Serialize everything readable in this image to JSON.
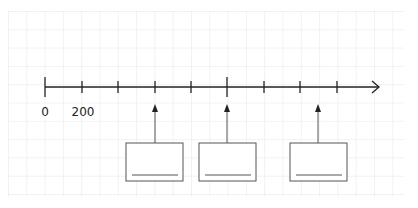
{
  "diagram": {
    "type": "number-line",
    "labels": [
      {
        "text": "0",
        "x": 45
      },
      {
        "text": "200",
        "x": 83
      }
    ],
    "axis": {
      "y": 87,
      "x_start": 45,
      "x_end": 379
    },
    "ticks": [
      {
        "x": 45,
        "major": true
      },
      {
        "x": 82,
        "major": false
      },
      {
        "x": 118,
        "major": false
      },
      {
        "x": 155,
        "major": false
      },
      {
        "x": 191,
        "major": false
      },
      {
        "x": 227,
        "major": true
      },
      {
        "x": 264,
        "major": false
      },
      {
        "x": 300,
        "major": false
      },
      {
        "x": 337,
        "major": false
      }
    ],
    "answer_boxes": [
      {
        "x": 126,
        "pointer_x": 155,
        "value": ""
      },
      {
        "x": 199,
        "pointer_x": 227,
        "value": ""
      },
      {
        "x": 290,
        "pointer_x": 318,
        "value": ""
      }
    ],
    "colors": {
      "line": "#222222",
      "box": "#555555",
      "grid": "#e6e6e6"
    }
  }
}
